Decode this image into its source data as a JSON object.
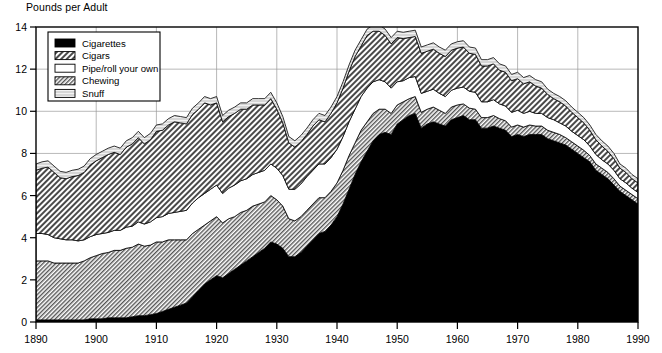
{
  "chart": {
    "title": "Pounds per Adult",
    "ylabel": "Pounds per Adult",
    "xlabel": ""
  },
  "axes": {
    "y_ticks": [
      "0",
      "2",
      "4",
      "6",
      "8",
      "10",
      "12",
      "14"
    ],
    "x_ticks": [
      "1890",
      "1900",
      "1910",
      "1920",
      "1930",
      "1940",
      "1950",
      "1960",
      "1970",
      "1980",
      "1990"
    ]
  },
  "legend": {
    "items": [
      {
        "label": "Cigarettes",
        "swatch": "solid-black"
      },
      {
        "label": "Cigars",
        "swatch": "hatch-coarse"
      },
      {
        "label": "Pipe/roll your own",
        "swatch": "white"
      },
      {
        "label": "Chewing",
        "swatch": "hatch-fine"
      },
      {
        "label": "Snuff",
        "swatch": "light-gray"
      }
    ]
  },
  "chart_data": {
    "type": "area",
    "stacked": true,
    "title": "Pounds per Adult",
    "xlabel": "",
    "ylabel": "Pounds per Adult",
    "xlim": [
      1890,
      1990
    ],
    "ylim": [
      0,
      14
    ],
    "grid": true,
    "legend_position": "top-left",
    "stack_order_bottom_to_top": [
      "Cigarettes",
      "Chewing",
      "Pipe/roll your own",
      "Cigars",
      "Snuff"
    ],
    "colors": {
      "Cigarettes": "#000000",
      "Cigars": "#b8b8b8",
      "Pipe/roll your own": "#ffffff",
      "Chewing": "#c8c8c8",
      "Snuff": "#d9d9d9"
    },
    "x": [
      1890,
      1891,
      1892,
      1893,
      1894,
      1895,
      1896,
      1897,
      1898,
      1899,
      1900,
      1901,
      1902,
      1903,
      1904,
      1905,
      1906,
      1907,
      1908,
      1909,
      1910,
      1911,
      1912,
      1913,
      1914,
      1915,
      1916,
      1917,
      1918,
      1919,
      1920,
      1921,
      1922,
      1923,
      1924,
      1925,
      1926,
      1927,
      1928,
      1929,
      1930,
      1931,
      1932,
      1933,
      1934,
      1935,
      1936,
      1937,
      1938,
      1939,
      1940,
      1941,
      1942,
      1943,
      1944,
      1945,
      1946,
      1947,
      1948,
      1949,
      1950,
      1951,
      1952,
      1953,
      1954,
      1955,
      1956,
      1957,
      1958,
      1959,
      1960,
      1961,
      1962,
      1963,
      1964,
      1965,
      1966,
      1967,
      1968,
      1969,
      1970,
      1971,
      1972,
      1973,
      1974,
      1975,
      1976,
      1977,
      1978,
      1979,
      1980,
      1981,
      1982,
      1983,
      1984,
      1985,
      1986,
      1987,
      1988,
      1989,
      1990
    ],
    "series": [
      {
        "name": "Cigarettes",
        "values": [
          0.1,
          0.1,
          0.1,
          0.1,
          0.1,
          0.1,
          0.1,
          0.1,
          0.1,
          0.15,
          0.15,
          0.15,
          0.2,
          0.2,
          0.2,
          0.2,
          0.25,
          0.3,
          0.3,
          0.35,
          0.4,
          0.5,
          0.6,
          0.7,
          0.8,
          0.9,
          1.2,
          1.5,
          1.8,
          2.0,
          2.2,
          2.1,
          2.3,
          2.5,
          2.7,
          2.9,
          3.1,
          3.3,
          3.5,
          3.8,
          3.7,
          3.5,
          3.1,
          3.1,
          3.3,
          3.6,
          3.9,
          4.2,
          4.3,
          4.6,
          5.0,
          5.6,
          6.3,
          7.0,
          7.6,
          8.1,
          8.6,
          8.9,
          9.0,
          8.9,
          9.4,
          9.6,
          9.8,
          9.9,
          9.2,
          9.4,
          9.5,
          9.4,
          9.3,
          9.6,
          9.7,
          9.8,
          9.6,
          9.6,
          9.2,
          9.2,
          9.3,
          9.2,
          9.1,
          8.8,
          8.9,
          8.8,
          8.9,
          8.9,
          8.9,
          8.7,
          8.6,
          8.5,
          8.4,
          8.2,
          8.0,
          7.8,
          7.6,
          7.2,
          7.0,
          6.8,
          6.5,
          6.2,
          6.0,
          5.8,
          5.6
        ]
      },
      {
        "name": "Chewing",
        "values": [
          2.8,
          2.8,
          2.8,
          2.7,
          2.7,
          2.7,
          2.7,
          2.7,
          2.8,
          2.9,
          3.0,
          3.1,
          3.1,
          3.2,
          3.2,
          3.3,
          3.3,
          3.4,
          3.3,
          3.3,
          3.4,
          3.3,
          3.3,
          3.2,
          3.1,
          3.0,
          3.0,
          2.9,
          2.8,
          2.8,
          2.8,
          2.6,
          2.6,
          2.5,
          2.5,
          2.4,
          2.4,
          2.3,
          2.2,
          2.2,
          2.1,
          2.0,
          1.8,
          1.7,
          1.7,
          1.7,
          1.7,
          1.7,
          1.6,
          1.6,
          1.6,
          1.6,
          1.6,
          1.5,
          1.5,
          1.4,
          1.3,
          1.2,
          1.1,
          1.0,
          0.9,
          0.85,
          0.8,
          0.8,
          0.75,
          0.7,
          0.7,
          0.65,
          0.6,
          0.6,
          0.6,
          0.55,
          0.55,
          0.5,
          0.5,
          0.5,
          0.5,
          0.45,
          0.45,
          0.45,
          0.45,
          0.45,
          0.45,
          0.4,
          0.4,
          0.4,
          0.4,
          0.4,
          0.35,
          0.35,
          0.35,
          0.35,
          0.3,
          0.3,
          0.3,
          0.3,
          0.3,
          0.25,
          0.25,
          0.25,
          0.25
        ]
      },
      {
        "name": "Pipe/roll your own",
        "values": [
          1.3,
          1.3,
          1.25,
          1.2,
          1.15,
          1.1,
          1.1,
          1.05,
          1.0,
          1.0,
          1.0,
          0.95,
          0.95,
          0.95,
          0.95,
          1.0,
          1.0,
          1.05,
          1.05,
          1.1,
          1.15,
          1.2,
          1.25,
          1.3,
          1.35,
          1.4,
          1.45,
          1.5,
          1.5,
          1.5,
          1.5,
          1.4,
          1.45,
          1.5,
          1.5,
          1.5,
          1.5,
          1.5,
          1.5,
          1.5,
          1.5,
          1.45,
          1.4,
          1.5,
          1.55,
          1.6,
          1.6,
          1.6,
          1.6,
          1.6,
          1.6,
          1.6,
          1.6,
          1.6,
          1.6,
          1.6,
          1.5,
          1.4,
          1.3,
          1.2,
          1.1,
          1.0,
          1.0,
          0.95,
          0.9,
          0.85,
          0.85,
          0.8,
          0.8,
          0.8,
          0.8,
          0.8,
          0.8,
          0.8,
          0.75,
          0.75,
          0.75,
          0.7,
          0.7,
          0.7,
          0.7,
          0.65,
          0.65,
          0.6,
          0.6,
          0.6,
          0.6,
          0.55,
          0.55,
          0.5,
          0.5,
          0.5,
          0.45,
          0.45,
          0.4,
          0.4,
          0.4,
          0.35,
          0.35,
          0.3,
          0.3
        ]
      },
      {
        "name": "Cigars",
        "values": [
          3.0,
          3.1,
          3.2,
          3.1,
          2.9,
          2.9,
          3.0,
          3.1,
          3.2,
          3.4,
          3.5,
          3.6,
          3.7,
          3.7,
          3.6,
          3.8,
          3.9,
          4.0,
          3.8,
          3.9,
          4.1,
          4.1,
          4.2,
          4.3,
          4.2,
          4.1,
          4.2,
          4.2,
          4.3,
          4.0,
          3.9,
          3.4,
          3.4,
          3.4,
          3.4,
          3.3,
          3.3,
          3.2,
          3.1,
          3.1,
          2.8,
          2.5,
          2.2,
          2.0,
          2.0,
          2.0,
          2.1,
          2.1,
          2.0,
          2.1,
          2.2,
          2.3,
          2.4,
          2.5,
          2.4,
          2.5,
          2.4,
          2.3,
          2.2,
          2.1,
          2.1,
          2.0,
          1.9,
          1.9,
          1.9,
          1.9,
          1.9,
          1.9,
          1.9,
          1.9,
          1.9,
          1.9,
          1.8,
          1.8,
          1.7,
          1.7,
          1.7,
          1.6,
          1.6,
          1.5,
          1.5,
          1.4,
          1.4,
          1.3,
          1.2,
          1.1,
          1.0,
          1.0,
          0.95,
          0.9,
          0.85,
          0.8,
          0.75,
          0.7,
          0.65,
          0.6,
          0.55,
          0.5,
          0.5,
          0.45,
          0.45
        ]
      },
      {
        "name": "Snuff",
        "values": [
          0.3,
          0.3,
          0.3,
          0.3,
          0.3,
          0.3,
          0.3,
          0.3,
          0.3,
          0.3,
          0.3,
          0.3,
          0.3,
          0.3,
          0.3,
          0.3,
          0.3,
          0.3,
          0.3,
          0.3,
          0.3,
          0.3,
          0.3,
          0.3,
          0.3,
          0.3,
          0.3,
          0.3,
          0.3,
          0.3,
          0.3,
          0.3,
          0.3,
          0.3,
          0.3,
          0.3,
          0.3,
          0.3,
          0.3,
          0.3,
          0.3,
          0.3,
          0.3,
          0.3,
          0.3,
          0.3,
          0.3,
          0.3,
          0.3,
          0.3,
          0.3,
          0.3,
          0.3,
          0.3,
          0.3,
          0.3,
          0.3,
          0.3,
          0.3,
          0.3,
          0.3,
          0.3,
          0.3,
          0.3,
          0.3,
          0.3,
          0.3,
          0.3,
          0.3,
          0.3,
          0.3,
          0.3,
          0.3,
          0.3,
          0.3,
          0.3,
          0.3,
          0.3,
          0.3,
          0.3,
          0.3,
          0.3,
          0.3,
          0.3,
          0.3,
          0.25,
          0.25,
          0.25,
          0.25,
          0.25,
          0.25,
          0.25,
          0.25,
          0.25,
          0.25,
          0.25,
          0.25,
          0.2,
          0.2,
          0.2,
          0.2
        ]
      }
    ]
  }
}
